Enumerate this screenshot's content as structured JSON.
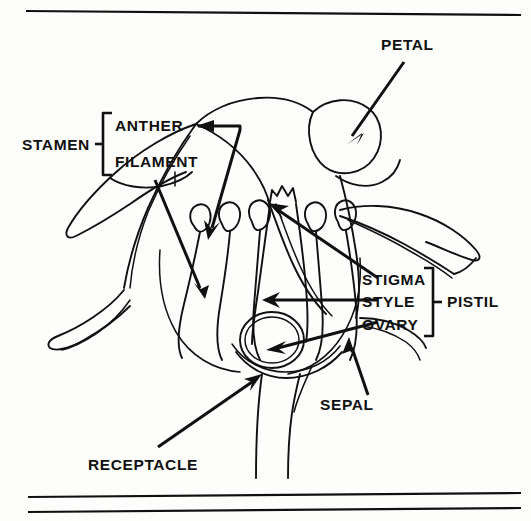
{
  "figure": {
    "kind": "botanical-line-diagram",
    "background_color": "#fdfdfc",
    "ink_color": "#101010"
  },
  "rules": {
    "top": {
      "name": "top-rule"
    },
    "bottom_upper": {
      "name": "bottom-rule-upper"
    },
    "bottom_lower": {
      "name": "bottom-rule-lower"
    }
  },
  "labels": {
    "petal": "PETAL",
    "stamen": "STAMEN",
    "anther": "ANTHER",
    "filament": "FILAMENT",
    "stigma": "STIGMA",
    "style": "STYLE",
    "ovary": "OVARY",
    "pistil": "PISTIL",
    "sepal": "SEPAL",
    "receptacle": "RECEPTACLE"
  },
  "groups": {
    "stamen_members": [
      "ANTHER",
      "FILAMENT"
    ],
    "pistil_members": [
      "STIGMA",
      "STYLE",
      "OVARY"
    ]
  },
  "leaders": {
    "petal": "diagonal arrow down-left into petal",
    "anther": "bent polyline right then down-left to anther",
    "filament": "straight diagonal down-right to filament",
    "stigma": "long diagonal up-left to stigma lobes",
    "style": "horizontal arrow left into style",
    "ovary": "diagonal arrow down-left into ovary",
    "sepal": "diagonal arrow up-left to sepal base",
    "receptacle": "diagonal arrow up-right to receptacle"
  },
  "organs": {
    "stamen_count": 5,
    "parts": [
      "petal",
      "sepal",
      "anther",
      "filament",
      "stigma",
      "style",
      "ovary",
      "receptacle",
      "stem"
    ]
  }
}
